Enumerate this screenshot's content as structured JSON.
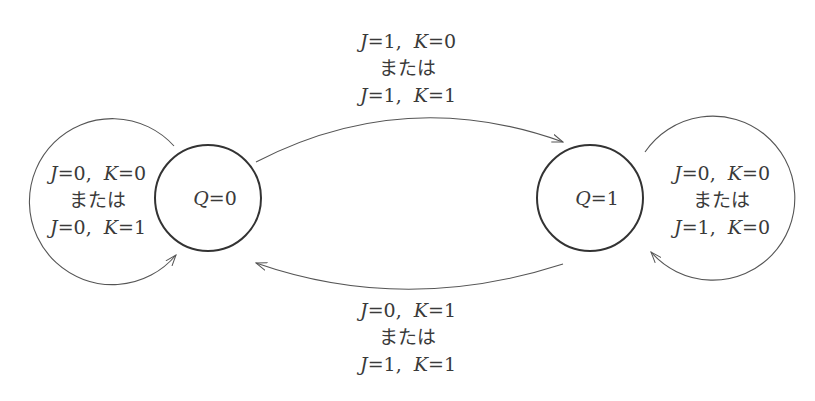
{
  "diagram": {
    "type": "state-transition",
    "states": [
      {
        "id": "q0",
        "label": "Q=0",
        "var": "Q",
        "value": "0"
      },
      {
        "id": "q1",
        "label": "Q=1",
        "var": "Q",
        "value": "1"
      }
    ],
    "transitions": [
      {
        "from": "q0",
        "to": "q0",
        "lines": [
          "J=0, K=0",
          "または",
          "J=0, K=1"
        ],
        "line1": {
          "j": "0",
          "k": "0"
        },
        "connector": "または",
        "line2": {
          "j": "0",
          "k": "1"
        }
      },
      {
        "from": "q0",
        "to": "q1",
        "lines": [
          "J=1, K=0",
          "または",
          "J=1, K=1"
        ],
        "line1": {
          "j": "1",
          "k": "0"
        },
        "connector": "または",
        "line2": {
          "j": "1",
          "k": "1"
        }
      },
      {
        "from": "q1",
        "to": "q0",
        "lines": [
          "J=0, K=1",
          "または",
          "J=1, K=1"
        ],
        "line1": {
          "j": "0",
          "k": "1"
        },
        "connector": "または",
        "line2": {
          "j": "1",
          "k": "1"
        }
      },
      {
        "from": "q1",
        "to": "q1",
        "lines": [
          "J=0, K=0",
          "または",
          "J=1, K=0"
        ],
        "line1": {
          "j": "0",
          "k": "0"
        },
        "connector": "または",
        "line2": {
          "j": "1",
          "k": "0"
        }
      }
    ],
    "colors": {
      "stroke": "#3a3a3a",
      "text": "#3a3a3a",
      "background": "#ffffff"
    }
  }
}
